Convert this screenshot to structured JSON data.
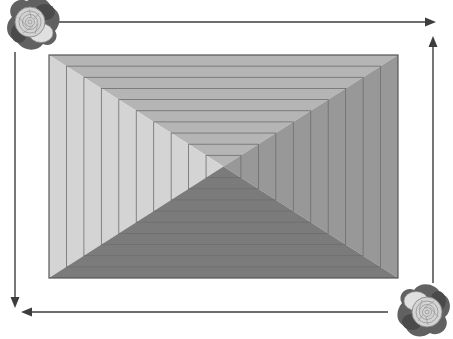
{
  "diagram": {
    "canvas": {
      "width": 453,
      "height": 339,
      "background": "#ffffff"
    },
    "tunnel": {
      "x": 49,
      "y": 55,
      "width": 349,
      "height": 223,
      "rings": 10,
      "border_color": "#565656",
      "ring_line_color": "#6e6e6e",
      "faces": {
        "top": "#b5b5b5",
        "left": "#d4d4d4",
        "right": "#989898",
        "bottom": "#7b7b7b"
      }
    },
    "arrows": {
      "color": "#3d3d3d",
      "stroke_width": 1.4,
      "head_length": 11,
      "head_width": 9,
      "items": [
        {
          "name": "top-arrow",
          "x1": 58,
          "y1": 22,
          "x2": 436,
          "y2": 22
        },
        {
          "name": "left-arrow",
          "x1": 15,
          "y1": 52,
          "x2": 15,
          "y2": 308
        },
        {
          "name": "right-arrow",
          "x1": 433,
          "y1": 283,
          "x2": 433,
          "y2": 36
        },
        {
          "name": "bottom-arrow",
          "x1": 388,
          "y1": 312,
          "x2": 21,
          "y2": 312
        }
      ]
    },
    "roses": {
      "colors": {
        "leaf_dark": "#4a4a4a",
        "leaf_mid": "#616161",
        "petal_light": "#d3d3d3",
        "petal_lighter": "#e0e0e0",
        "petal_line": "#969696",
        "petal_edge": "#8a8a8a"
      },
      "items": [
        {
          "name": "rose-top-left",
          "cx": 33,
          "cy": 25,
          "rotation": 0,
          "scale": 1.0
        },
        {
          "name": "rose-bottom-right",
          "cx": 424,
          "cy": 309,
          "rotation": 180,
          "scale": 1.0
        }
      ]
    }
  }
}
